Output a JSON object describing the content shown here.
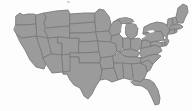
{
  "figure": {
    "kind": "choropleth-outline-map",
    "title": "",
    "caption": "",
    "has_labels": false,
    "has_legend": false,
    "has_text": false,
    "projection_look": "albers-usa",
    "width_px": 192,
    "height_px": 111
  },
  "colors": {
    "background": "#fdfdfd",
    "state_fill": "#9b9b9b",
    "state_border": "#7a7a7a",
    "lake_fill": "#fdfdfd",
    "artifact": "#b9b9b9"
  },
  "regions": [
    {
      "code": "WA",
      "name": "Washington"
    },
    {
      "code": "OR",
      "name": "Oregon"
    },
    {
      "code": "CA",
      "name": "California"
    },
    {
      "code": "ID",
      "name": "Idaho"
    },
    {
      "code": "NV",
      "name": "Nevada"
    },
    {
      "code": "UT",
      "name": "Utah"
    },
    {
      "code": "AZ",
      "name": "Arizona"
    },
    {
      "code": "MT",
      "name": "Montana"
    },
    {
      "code": "WY",
      "name": "Wyoming"
    },
    {
      "code": "CO",
      "name": "Colorado"
    },
    {
      "code": "NM",
      "name": "New Mexico"
    },
    {
      "code": "ND",
      "name": "North Dakota"
    },
    {
      "code": "SD",
      "name": "South Dakota"
    },
    {
      "code": "NE",
      "name": "Nebraska"
    },
    {
      "code": "KS",
      "name": "Kansas"
    },
    {
      "code": "OK",
      "name": "Oklahoma"
    },
    {
      "code": "TX",
      "name": "Texas"
    },
    {
      "code": "MN",
      "name": "Minnesota"
    },
    {
      "code": "IA",
      "name": "Iowa"
    },
    {
      "code": "MO",
      "name": "Missouri"
    },
    {
      "code": "AR",
      "name": "Arkansas"
    },
    {
      "code": "LA",
      "name": "Louisiana"
    },
    {
      "code": "WI",
      "name": "Wisconsin"
    },
    {
      "code": "IL",
      "name": "Illinois"
    },
    {
      "code": "MI",
      "name": "Michigan"
    },
    {
      "code": "IN",
      "name": "Indiana"
    },
    {
      "code": "OH",
      "name": "Ohio"
    },
    {
      "code": "KY",
      "name": "Kentucky"
    },
    {
      "code": "TN",
      "name": "Tennessee"
    },
    {
      "code": "MS",
      "name": "Mississippi"
    },
    {
      "code": "AL",
      "name": "Alabama"
    },
    {
      "code": "GA",
      "name": "Georgia"
    },
    {
      "code": "FL",
      "name": "Florida"
    },
    {
      "code": "SC",
      "name": "South Carolina"
    },
    {
      "code": "NC",
      "name": "North Carolina"
    },
    {
      "code": "VA",
      "name": "Virginia"
    },
    {
      "code": "WV",
      "name": "West Virginia"
    },
    {
      "code": "MD",
      "name": "Maryland"
    },
    {
      "code": "DE",
      "name": "Delaware"
    },
    {
      "code": "PA",
      "name": "Pennsylvania"
    },
    {
      "code": "NJ",
      "name": "New Jersey"
    },
    {
      "code": "NY",
      "name": "New York"
    },
    {
      "code": "CT",
      "name": "Connecticut"
    },
    {
      "code": "RI",
      "name": "Rhode Island"
    },
    {
      "code": "MA",
      "name": "Massachusetts"
    },
    {
      "code": "VT",
      "name": "Vermont"
    },
    {
      "code": "NH",
      "name": "New Hampshire"
    },
    {
      "code": "ME",
      "name": "Maine"
    }
  ],
  "water_bodies": [
    {
      "name": "Lake Michigan"
    },
    {
      "name": "Lake Superior"
    },
    {
      "name": "Lake Huron"
    },
    {
      "name": "Lake Erie"
    },
    {
      "name": "Lake Ontario"
    }
  ]
}
